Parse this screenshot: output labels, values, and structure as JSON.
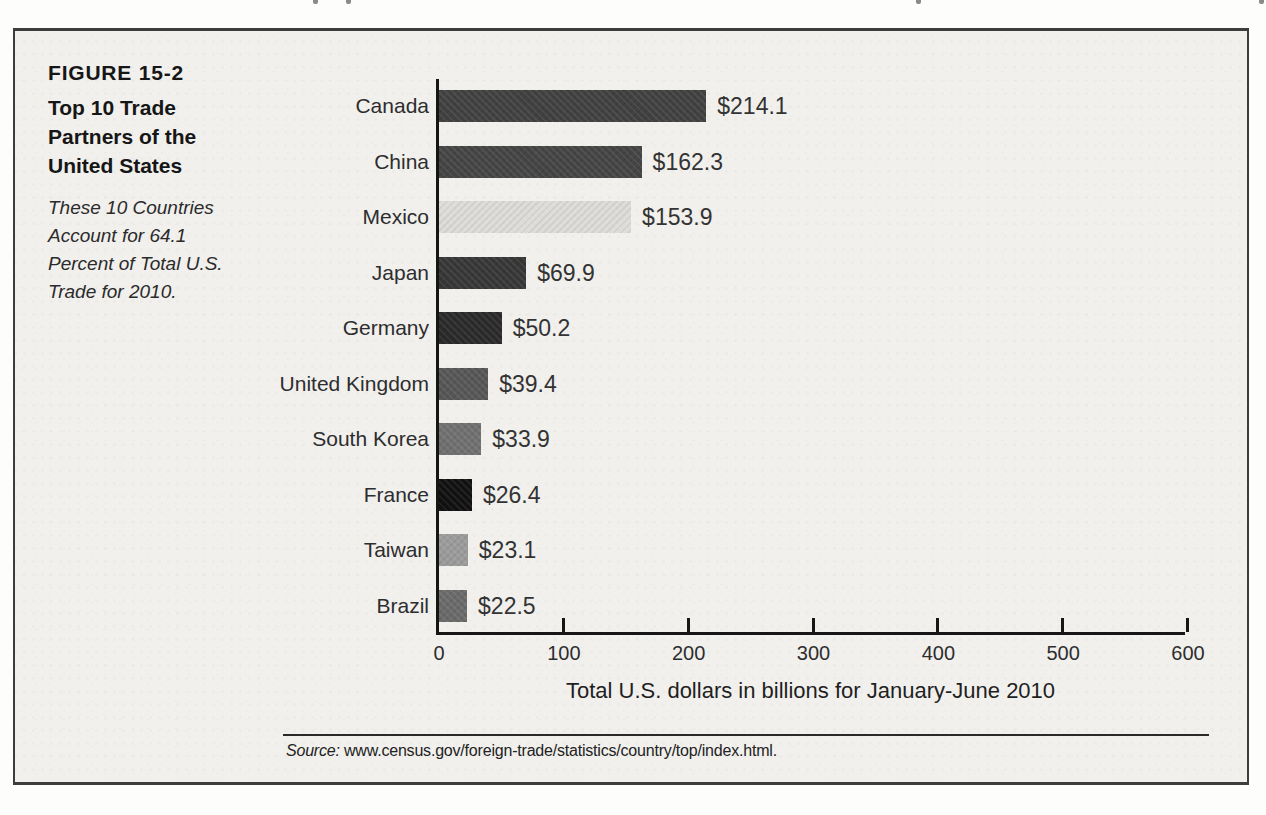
{
  "figure": {
    "label": "FIGURE 15-2",
    "title": "Top 10 Trade\nPartners of the\nUnited States",
    "note": "These 10 Countries\nAccount for 64.1\nPercent of Total U.S.\nTrade for 2010.",
    "axis_label": "Total U.S. dollars in billions for January-June 2010",
    "source_prefix": "Source:",
    "source_text": " www.census.gov/foreign-trade/statistics/country/top/index.html."
  },
  "colors": {
    "figure_background": "#f1f0ed",
    "figure_border": "#3d3d3d",
    "axis": "#161616",
    "text": "#2d2d2d"
  },
  "chart_data": {
    "type": "bar",
    "orientation": "horizontal",
    "title": "Top 10 Trade Partners of the United States",
    "subtitle": "These 10 Countries Account for 64.1 Percent of Total U.S. Trade for 2010.",
    "categories": [
      "Canada",
      "China",
      "Mexico",
      "Japan",
      "Germany",
      "United Kingdom",
      "South Korea",
      "France",
      "Taiwan",
      "Brazil"
    ],
    "values": [
      214.1,
      162.3,
      153.9,
      69.9,
      50.2,
      39.4,
      33.9,
      26.4,
      23.1,
      22.5
    ],
    "value_labels": [
      "$214.1",
      "$162.3",
      "$153.9",
      "$69.9",
      "$50.2",
      "$39.4",
      "$33.9",
      "$26.4",
      "$23.1",
      "$22.5"
    ],
    "bar_colors": [
      "#414141",
      "#454545",
      "#dedcd8",
      "#373737",
      "#2a2a2a",
      "#575757",
      "#707070",
      "#111111",
      "#9b9b9b",
      "#6a6a6a"
    ],
    "xlabel": "Total U.S. dollars in billions for January-June 2010",
    "xlim": [
      0,
      600
    ],
    "xticks": [
      0,
      100,
      200,
      300,
      400,
      500,
      600
    ],
    "grid": false,
    "legend": false,
    "source": "Source: www.census.gov/foreign-trade/statistics/country/top/index.html."
  }
}
